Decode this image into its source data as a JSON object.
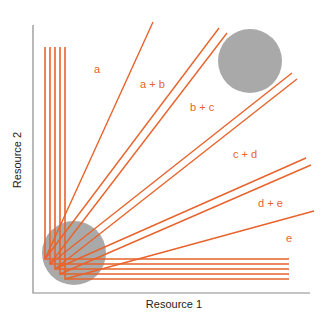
{
  "diagram": {
    "type": "resource-competition-zngi",
    "axes": {
      "x_label": "Resource 1",
      "y_label": "Resource 2"
    },
    "region_labels": [
      {
        "text": "a",
        "x": 94,
        "y": 73
      },
      {
        "text": "a + b",
        "x": 140,
        "y": 88
      },
      {
        "text": "b + c",
        "x": 190,
        "y": 111
      },
      {
        "text": "c + d",
        "x": 233,
        "y": 158
      },
      {
        "text": "d + e",
        "x": 258,
        "y": 207
      },
      {
        "text": "e",
        "x": 286,
        "y": 242
      }
    ],
    "zngi_corners": [
      {
        "species": "a",
        "x": 45,
        "y": 259
      },
      {
        "species": "b",
        "x": 50,
        "y": 264
      },
      {
        "species": "c",
        "x": 55,
        "y": 269
      },
      {
        "species": "d",
        "x": 60,
        "y": 274
      },
      {
        "species": "e",
        "x": 65,
        "y": 279
      }
    ],
    "isocline_top_y": 47,
    "isocline_right_x": 289,
    "consumption_vectors": [
      {
        "from": "a",
        "to_x": 153,
        "to_y": 22
      },
      {
        "from": "a",
        "to_x": 219,
        "to_y": 28
      },
      {
        "from": "b",
        "to_x": 227,
        "to_y": 33
      },
      {
        "from": "b",
        "to_x": 292,
        "to_y": 73
      },
      {
        "from": "c",
        "to_x": 297,
        "to_y": 79
      },
      {
        "from": "c",
        "to_x": 306,
        "to_y": 158
      },
      {
        "from": "d",
        "to_x": 311,
        "to_y": 165
      },
      {
        "from": "e",
        "to_x": 314,
        "to_y": 211
      }
    ],
    "supply_points": [
      {
        "name": "high-supply",
        "cx": 250,
        "cy": 61,
        "r": 32
      },
      {
        "name": "low-supply",
        "cx": 74,
        "cy": 253,
        "r": 32
      }
    ],
    "colors": {
      "lines": "#e8632b",
      "supply": "#9a9a9a",
      "axis": "#8a8a8a"
    }
  }
}
